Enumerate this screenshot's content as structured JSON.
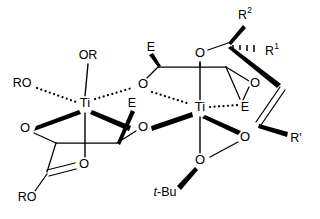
{
  "figure": {
    "kind": "chemical-structure",
    "background_color": "#ffffff",
    "line_color": "#000000"
  },
  "atoms": {
    "titanium_left": "Ti",
    "titanium_right": "Ti",
    "oxygen": "O"
  },
  "labels": {
    "alkoxide_top": "OR",
    "alkoxide_left": "RO",
    "ester_bottom_left": "RO",
    "ester_carbonyl_oxygen": "O",
    "ester_alkoxy_oxygen": "O",
    "tartrate_ester_left": "E",
    "tartrate_ester_right": "E",
    "tartrate_ester_upper_left": "E",
    "tartrate_ester_lower_right": "E",
    "tert_butyl": "t-Bu",
    "tert_butyl_italic": "t",
    "tert_butyl_rest": "-Bu",
    "substituent_r2": "R",
    "substituent_r2_sup": "2",
    "substituent_r1": "R",
    "substituent_r1_sup": "1",
    "substituent_rprime": "R'",
    "oxygen_bridge_upper": "O",
    "oxygen_bridge_lower": "O",
    "oxygen_left_chelate": "O",
    "oxygen_right_chelate": "O",
    "oxygen_allylic": "O",
    "oxygen_peroxide_inner": "O",
    "oxygen_peroxide_outer": "O"
  },
  "atom_positions": {
    "ti_left": {
      "x": 85,
      "y": 104,
      "label": "Ti"
    },
    "ti_right": {
      "x": 200,
      "y": 108,
      "label": "Ti"
    },
    "o_alkoxide_top": {
      "x": 88,
      "y": 56,
      "label": "OR"
    },
    "o_alkoxide_left": {
      "x": 22,
      "y": 84,
      "label": "RO"
    },
    "o_chelate_left": {
      "x": 25,
      "y": 129,
      "label": "O"
    },
    "o_bridge_lower": {
      "x": 143,
      "y": 128,
      "label": "O"
    },
    "o_bridge_upper": {
      "x": 143,
      "y": 85,
      "label": "O"
    },
    "o_ester_bottom": {
      "x": 84,
      "y": 165,
      "label": "O"
    },
    "o_ester_ro": {
      "x": 27,
      "y": 198,
      "label": "RO"
    },
    "e_left": {
      "x": 132,
      "y": 104,
      "label": "E"
    },
    "e_upper": {
      "x": 151,
      "y": 48,
      "label": "E"
    },
    "e_right": {
      "x": 245,
      "y": 108,
      "label": "E"
    },
    "o_allylic_top": {
      "x": 200,
      "y": 54,
      "label": "O"
    },
    "o_epoxide_right": {
      "x": 255,
      "y": 84,
      "label": "O"
    },
    "o_peroxide_inner": {
      "x": 245,
      "y": 138,
      "label": "O"
    },
    "o_peroxide_outer": {
      "x": 200,
      "y": 161,
      "label": "O"
    },
    "tbu": {
      "x": 165,
      "y": 193,
      "label": "t-Bu"
    },
    "r2": {
      "x": 245,
      "y": 16,
      "label": "R2"
    },
    "r1": {
      "x": 272,
      "y": 52,
      "label": "R1"
    },
    "rprime": {
      "x": 294,
      "y": 139,
      "label": "R'"
    }
  },
  "bond_types": {
    "plain": "solid line",
    "bold_wedge": "stereochemical wedge toward viewer",
    "dotted": "dative / dashed coordination bond",
    "double": "double bond"
  }
}
